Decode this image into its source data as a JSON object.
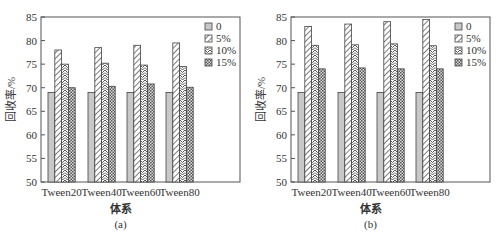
{
  "chart_data": [
    {
      "type": "bar",
      "title": "(a)",
      "xlabel": "体系",
      "ylabel": "回收率/%",
      "ylim": [
        50,
        85
      ],
      "yticks": [
        50,
        55,
        60,
        65,
        70,
        75,
        80,
        85
      ],
      "categories": [
        "Tween20",
        "Tween40",
        "Tween60",
        "Tween80"
      ],
      "series": [
        {
          "name": "0",
          "values": [
            69,
            69,
            69,
            69
          ]
        },
        {
          "name": "5%",
          "values": [
            78,
            78.5,
            79,
            79.5
          ]
        },
        {
          "name": "10%",
          "values": [
            75,
            75.2,
            74.8,
            74.5
          ]
        },
        {
          "name": "15%",
          "values": [
            70,
            70.3,
            70.8,
            70.1
          ]
        }
      ],
      "legend_position": "top-right",
      "grid": false
    },
    {
      "type": "bar",
      "title": "(b)",
      "xlabel": "体系",
      "ylabel": "回收率/%",
      "ylim": [
        50,
        85
      ],
      "yticks": [
        50,
        55,
        60,
        65,
        70,
        75,
        80,
        85
      ],
      "categories": [
        "Tween20",
        "Tween40",
        "Tween60",
        "Tween80"
      ],
      "series": [
        {
          "name": "0",
          "values": [
            69,
            69,
            69,
            69
          ]
        },
        {
          "name": "5%",
          "values": [
            83,
            83.5,
            84,
            84.5
          ]
        },
        {
          "name": "10%",
          "values": [
            79,
            79.1,
            79.3,
            78.9
          ]
        },
        {
          "name": "15%",
          "values": [
            74,
            74.2,
            74,
            74
          ]
        }
      ],
      "legend_position": "top-right",
      "grid": false
    }
  ],
  "panels": [
    {
      "caption": "(a)",
      "xlabel": "体系",
      "ylabel": "回收率/%"
    },
    {
      "caption": "(b)",
      "xlabel": "体系",
      "ylabel": "回收率/%"
    }
  ]
}
